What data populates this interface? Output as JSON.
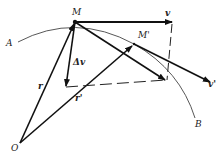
{
  "diagram": {
    "title": "",
    "colors": {
      "ink": "#111111",
      "arc": "#444444",
      "background": "#ffffff"
    },
    "labels": {
      "A": "A",
      "B": "B",
      "M": "M",
      "M_prime": "M'",
      "O": "O",
      "r": "r",
      "r_prime": "r'",
      "v": "v",
      "v_prime": "v'",
      "delta_v": "Δv"
    },
    "elements": [
      "trajectory arc from A through M and M' to B",
      "position vector r from O to M",
      "position vector r' from O to M'",
      "velocity vector v at M",
      "velocity vector v' at M'",
      "velocity v' translated to M",
      "velocity change Δv",
      "dashed parallelogram construction lines"
    ]
  }
}
